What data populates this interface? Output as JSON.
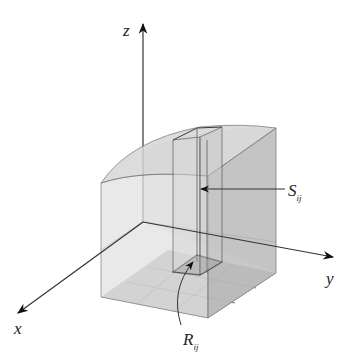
{
  "figure": {
    "type": "3d-solid-with-partition",
    "axes": {
      "x_label": "x",
      "y_label": "y",
      "z_label": "z"
    },
    "labels": {
      "surface_patch": {
        "main": "S",
        "subscript": "ij"
      },
      "base_rectangle": {
        "main": "R",
        "subscript": "ij"
      }
    },
    "grid": {
      "rows": 3,
      "cols": 3
    },
    "colors": {
      "background": "#ffffff",
      "solid_face_light": "#e4e4e4",
      "solid_face_mid": "#d2d2d2",
      "solid_face_dark": "#c2c2c2",
      "base_grid": "#a8a8a8",
      "edge": "#555555",
      "axis": "#333333"
    }
  }
}
